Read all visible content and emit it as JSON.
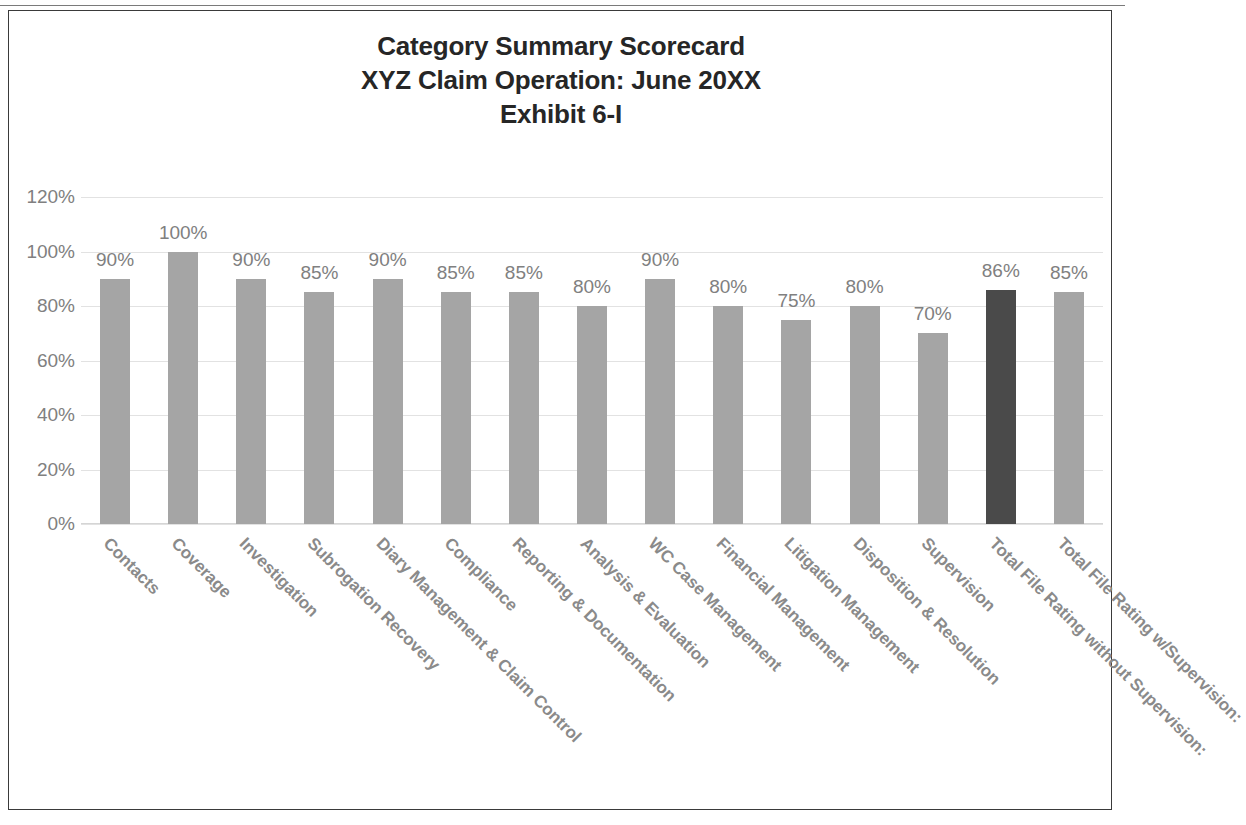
{
  "document": {
    "frame_border_color": "#3a3a3a",
    "background": "#ffffff"
  },
  "title": {
    "line1": "Category Summary Scorecard",
    "line2": "XYZ Claim Operation: June 20XX",
    "line3": "Exhibit 6-I"
  },
  "colors": {
    "bar": "#a5a5a5",
    "bar_highlight": "#4a4a4a",
    "axis_text": "#808080",
    "category_text": "#8a8a8a",
    "gridline": "#e2e2e2",
    "title_text": "#262626"
  },
  "chart_data": {
    "type": "bar",
    "title": "Category Summary Scorecard XYZ Claim Operation: June 20XX Exhibit 6-I",
    "xlabel": "",
    "ylabel": "",
    "ylim": [
      0,
      120
    ],
    "ytick_labels": [
      "120%",
      "100%",
      "80%",
      "60%",
      "40%",
      "20%",
      "0%"
    ],
    "ytick_values": [
      120,
      100,
      80,
      60,
      40,
      20,
      0
    ],
    "grid": true,
    "legend": "none",
    "categories": [
      "Contacts",
      "Coverage",
      "Investigation",
      "Subrogation Recovery",
      "Diary Management & Claim Control",
      "Compliance",
      "Reporting & Documentation",
      "Analysis & Evaluation",
      "WC Case Management",
      "Financial Management",
      "Litigation Management",
      "Disposition & Resolution",
      "Supervision",
      "Total File Rating without Supervision:",
      "Total File Rating w/Supervision:"
    ],
    "values": [
      90,
      100,
      90,
      85,
      90,
      85,
      85,
      80,
      90,
      80,
      75,
      80,
      70,
      86,
      85
    ],
    "data_labels": [
      "90%",
      "100%",
      "90%",
      "85%",
      "90%",
      "85%",
      "85%",
      "80%",
      "90%",
      "80%",
      "75%",
      "80%",
      "70%",
      "86%",
      "85%"
    ],
    "highlight_index": 13
  }
}
